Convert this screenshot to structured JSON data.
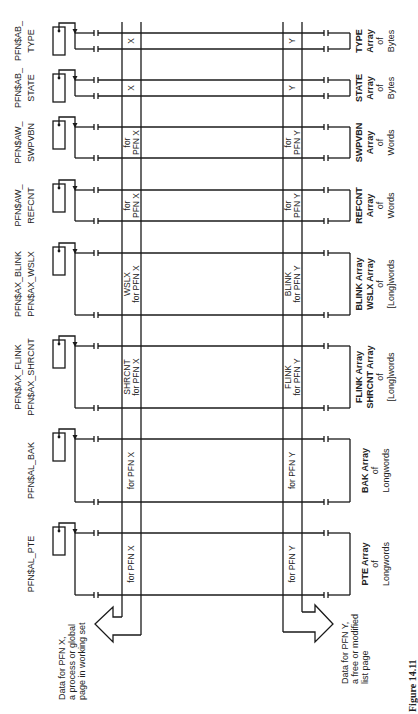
{
  "figure": {
    "caption": "Figure 14.11",
    "orientation": "rotated 90 degrees counter-clockwise"
  },
  "arrays": [
    {
      "id": "type",
      "pointer_label": [
        "PFN$AB_",
        "TYPE"
      ],
      "array_label": [
        "TYPE",
        "Array",
        "of",
        "Bytes"
      ],
      "x_entry": [
        "X"
      ],
      "y_entry": [
        "Y"
      ],
      "top": 33,
      "bottom": 49
    },
    {
      "id": "state",
      "pointer_label": [
        "PFN$AB_",
        "STATE"
      ],
      "array_label": [
        "STATE",
        "Array",
        "of",
        "Bytes"
      ],
      "x_entry": [
        "X"
      ],
      "y_entry": [
        "Y"
      ],
      "top": 80,
      "bottom": 96
    },
    {
      "id": "swpvbn",
      "pointer_label": [
        "PFN$AW_",
        "SWPVBN"
      ],
      "array_label": [
        "SWPVBN",
        "Array",
        "of",
        "Words"
      ],
      "x_entry": [
        "for",
        "PFN X"
      ],
      "y_entry": [
        "for",
        "PFN Y"
      ],
      "top": 127,
      "bottom": 158
    },
    {
      "id": "refcnt",
      "pointer_label": [
        "PFN$AW_",
        "REFCNT"
      ],
      "array_label": [
        "REFCNT",
        "Array",
        "of",
        "Words"
      ],
      "x_entry": [
        "for",
        "PFN X"
      ],
      "y_entry": [
        "for",
        "PFN Y"
      ],
      "top": 190,
      "bottom": 221
    },
    {
      "id": "blink",
      "pointer_label": [
        "PFN$AX_BLINK",
        "PFN$AX_WSLX"
      ],
      "array_label": [
        "BLINK Array",
        "WSLX Array",
        "of",
        "[Long]words"
      ],
      "x_entry": [
        "WSLX",
        "for PFN X"
      ],
      "y_entry": [
        "BLINK",
        "for PFN Y"
      ],
      "top": 253,
      "bottom": 315
    },
    {
      "id": "flink",
      "pointer_label": [
        "PFN$AX_FLINK",
        "PFN$AX_SHRCNT"
      ],
      "array_label": [
        "FLINK Array",
        "SHRCNT Array",
        "of",
        "[Long]words"
      ],
      "x_entry": [
        "SHRCNT",
        "for PFN X"
      ],
      "y_entry": [
        "FLINK",
        "for PFN Y"
      ],
      "top": 346,
      "bottom": 408
    },
    {
      "id": "bak",
      "pointer_label": [
        "PFN$AL_BAK"
      ],
      "array_label": [
        "BAK Array",
        "of",
        "Longwords"
      ],
      "x_entry": [
        "for PFN X"
      ],
      "y_entry": [
        "for PFN Y"
      ],
      "top": 439,
      "bottom": 502
    },
    {
      "id": "pte",
      "pointer_label": [
        "PFN$AL_PTE"
      ],
      "array_label": [
        "PTE Array",
        "of",
        "Longwords"
      ],
      "x_entry": [
        "for PFN X"
      ],
      "y_entry": [
        "for PFN Y"
      ],
      "top": 533,
      "bottom": 595
    }
  ],
  "callouts": {
    "pfn_x": [
      "Data for PFN X,",
      "a process or global",
      "page in working set"
    ],
    "pfn_y": [
      "Data for PFN Y,",
      "a free or modified",
      "list page"
    ]
  },
  "colors": {
    "line": "#1a1a1a",
    "text": "#222222",
    "background": "#ffffff"
  }
}
